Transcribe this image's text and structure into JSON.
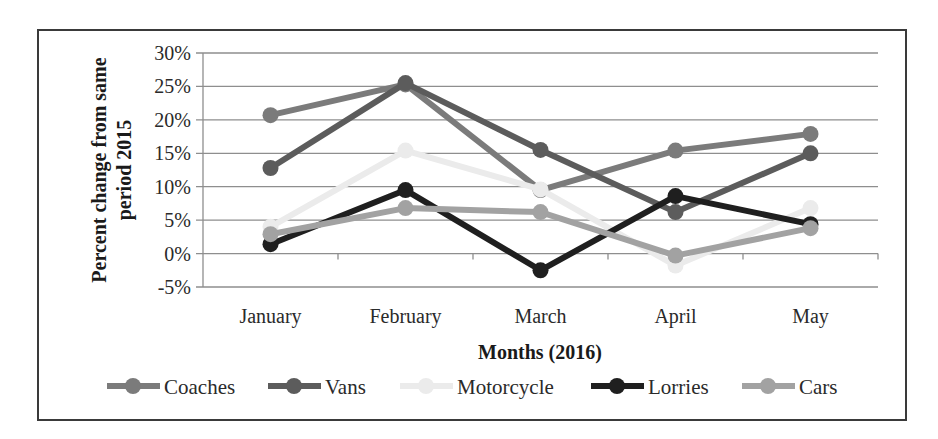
{
  "chart_data": {
    "type": "line",
    "title": "",
    "xlabel": "Months (2016)",
    "ylabel": "Percent change from same period 2015",
    "ylabel_lines": [
      "Percent change from same",
      "period 2015"
    ],
    "categories": [
      "January",
      "February",
      "March",
      "April",
      "May"
    ],
    "ylim": [
      -5,
      30
    ],
    "yticks": [
      -5,
      0,
      5,
      10,
      15,
      20,
      25,
      30
    ],
    "ytick_labels": [
      "-5%",
      "0%",
      "5%",
      "10%",
      "15%",
      "20%",
      "25%",
      "30%"
    ],
    "grid": true,
    "legend_position": "bottom",
    "series": [
      {
        "name": "Coaches",
        "color": "#7b7b7b",
        "values": [
          20.7,
          25.3,
          9.5,
          15.4,
          17.9
        ]
      },
      {
        "name": "Vans",
        "color": "#5c5c5c",
        "values": [
          12.8,
          25.5,
          15.5,
          6.2,
          15.0
        ]
      },
      {
        "name": "Motorcycle",
        "color": "#ebebeb",
        "values": [
          4.0,
          15.4,
          9.6,
          -1.8,
          6.8
        ]
      },
      {
        "name": "Lorries",
        "color": "#1f1f1f",
        "values": [
          1.4,
          9.5,
          -2.5,
          8.6,
          4.4
        ]
      },
      {
        "name": "Cars",
        "color": "#a2a2a2",
        "values": [
          2.9,
          6.8,
          6.2,
          -0.3,
          3.8
        ]
      }
    ]
  },
  "layout": {
    "plot_left": 203,
    "plot_right": 878,
    "y_top": 53,
    "y_bottom": 287
  }
}
